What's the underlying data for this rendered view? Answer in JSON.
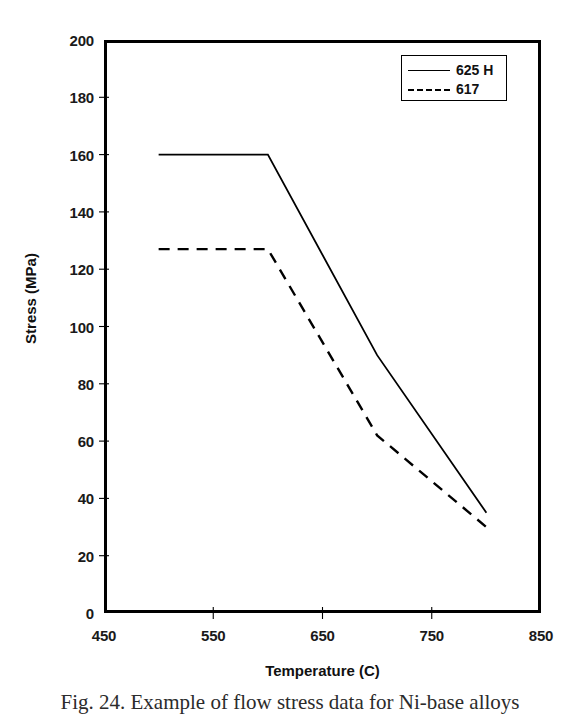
{
  "chart_data": {
    "type": "line",
    "title": "",
    "xlabel": "Temperature (C)",
    "ylabel": "Stress (MPa)",
    "xlim": [
      450,
      850
    ],
    "ylim": [
      0,
      200
    ],
    "xticks": [
      450,
      550,
      650,
      750,
      850
    ],
    "yticks": [
      0,
      20,
      40,
      60,
      80,
      100,
      120,
      140,
      160,
      180,
      200
    ],
    "grid": false,
    "legend_position": "top-right",
    "series": [
      {
        "name": "625 H",
        "style": "solid",
        "color": "#000000",
        "x": [
          500,
          600,
          700,
          800
        ],
        "y": [
          160,
          160,
          90,
          35
        ]
      },
      {
        "name": "617",
        "style": "dashed",
        "color": "#000000",
        "x": [
          500,
          600,
          700,
          800
        ],
        "y": [
          127,
          127,
          62,
          30
        ]
      }
    ]
  },
  "axes": {
    "x_title": "Temperature (C)",
    "y_title": "Stress (MPa)",
    "x_tick_labels": [
      "450",
      "550",
      "650",
      "750",
      "850"
    ],
    "y_tick_labels": [
      "0",
      "20",
      "40",
      "60",
      "80",
      "100",
      "120",
      "140",
      "160",
      "180",
      "200"
    ]
  },
  "legend": {
    "entries": [
      {
        "label": "625 H",
        "style": "solid"
      },
      {
        "label": "617",
        "style": "dashed"
      }
    ]
  },
  "caption": {
    "text": "Fig. 24. Example of flow stress data for Ni-base alloys"
  }
}
